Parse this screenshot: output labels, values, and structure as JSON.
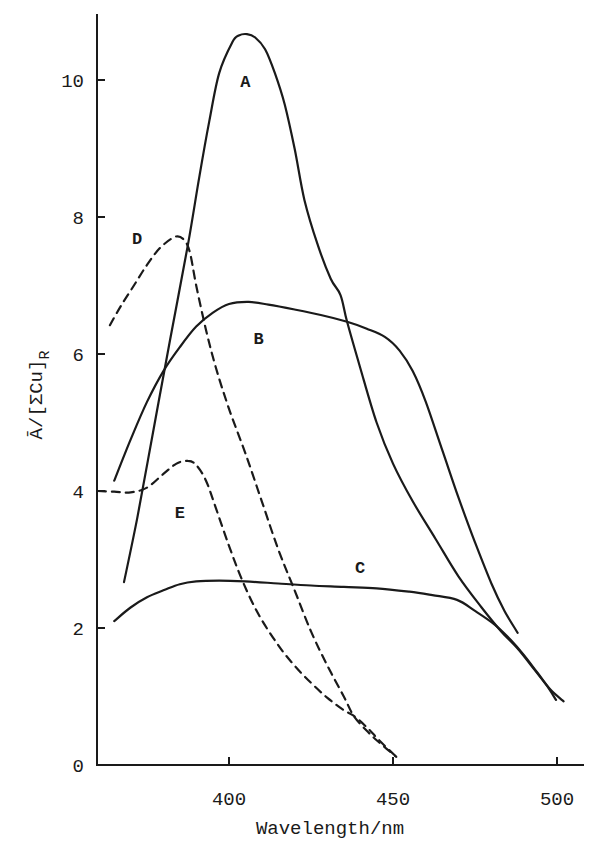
{
  "chart_data": {
    "type": "line",
    "title": "",
    "xlabel": "Wavelength/nm",
    "ylabel": "Ā/[ΣCu]R",
    "ylabel_main": "Ā/[ΣCu]",
    "ylabel_sub": "R",
    "xlim": [
      360,
      508
    ],
    "ylim": [
      0,
      11
    ],
    "xticks": [
      400,
      450,
      500
    ],
    "yticks": [
      0,
      2,
      4,
      6,
      8,
      10
    ],
    "grid": false,
    "legend": "inline curve labels",
    "series": [
      {
        "name": "A",
        "style": "solid",
        "label_pos": [
          405,
          9.9
        ],
        "x": [
          368,
          372,
          377,
          382,
          387.5,
          391,
          394,
          397,
          401,
          403,
          405.5,
          408,
          411,
          414,
          417,
          420,
          423,
          427,
          431,
          434,
          436,
          440,
          445,
          450,
          456,
          463,
          470,
          477,
          483,
          488,
          493,
          497,
          499.7
        ],
        "y": [
          2.67,
          3.6,
          4.9,
          6.2,
          7.6,
          8.6,
          9.4,
          10.1,
          10.55,
          10.65,
          10.67,
          10.62,
          10.45,
          10.1,
          9.64,
          9.0,
          8.25,
          7.6,
          7.1,
          6.86,
          6.47,
          5.8,
          5.0,
          4.4,
          3.85,
          3.3,
          2.75,
          2.3,
          1.95,
          1.7,
          1.4,
          1.15,
          0.95
        ]
      },
      {
        "name": "B",
        "style": "solid",
        "label_pos": [
          409,
          6.15
        ],
        "x": [
          365,
          370,
          375,
          380,
          385,
          390,
          395,
          400,
          406,
          412,
          420,
          428,
          436,
          442,
          447.5,
          452,
          456,
          460,
          465,
          470,
          475,
          480,
          484,
          488
        ],
        "y": [
          4.15,
          4.75,
          5.3,
          5.75,
          6.1,
          6.4,
          6.6,
          6.73,
          6.76,
          6.72,
          6.65,
          6.57,
          6.47,
          6.37,
          6.25,
          6.05,
          5.75,
          5.3,
          4.6,
          3.9,
          3.25,
          2.65,
          2.25,
          1.93
        ]
      },
      {
        "name": "C",
        "style": "solid",
        "label_pos": [
          440,
          2.8
        ],
        "x": [
          365,
          370,
          375,
          380,
          385,
          390,
          397,
          405,
          415,
          425,
          435,
          445,
          455,
          462,
          469.5,
          475,
          481,
          486,
          490,
          494,
          498,
          502
        ],
        "y": [
          2.1,
          2.3,
          2.45,
          2.55,
          2.64,
          2.68,
          2.69,
          2.68,
          2.65,
          2.62,
          2.6,
          2.58,
          2.53,
          2.48,
          2.41,
          2.25,
          2.05,
          1.82,
          1.6,
          1.35,
          1.1,
          0.93
        ]
      },
      {
        "name": "D",
        "style": "dashed",
        "label_pos": [
          372,
          7.6
        ],
        "x": [
          363.7,
          367,
          371,
          375,
          379,
          383.5,
          386,
          388,
          390,
          393,
          396,
          400,
          405,
          410,
          415,
          420,
          425,
          430,
          435,
          438,
          442,
          446,
          451
        ],
        "y": [
          6.42,
          6.7,
          7.0,
          7.3,
          7.55,
          7.71,
          7.68,
          7.5,
          7.0,
          6.35,
          5.8,
          5.2,
          4.55,
          3.85,
          3.15,
          2.55,
          1.95,
          1.45,
          1.0,
          0.72,
          0.5,
          0.32,
          0.12
        ]
      },
      {
        "name": "E",
        "style": "dashed",
        "label_pos": [
          385,
          3.6
        ],
        "x": [
          360,
          365,
          370,
          375,
          380,
          384,
          387.5,
          390,
          393,
          396,
          400,
          404,
          409,
          415,
          420,
          425,
          430,
          435,
          438,
          442,
          446,
          451
        ],
        "y": [
          4.0,
          3.99,
          3.98,
          4.05,
          4.25,
          4.4,
          4.44,
          4.38,
          4.15,
          3.75,
          3.2,
          2.7,
          2.2,
          1.75,
          1.45,
          1.2,
          0.98,
          0.8,
          0.72,
          0.55,
          0.35,
          0.12
        ]
      }
    ]
  },
  "layout": {
    "x_origin_px": 229,
    "x_origin_val": 400,
    "px_per_x": 3.28,
    "y_zero_px": 765,
    "px_per_y": 68.5
  }
}
